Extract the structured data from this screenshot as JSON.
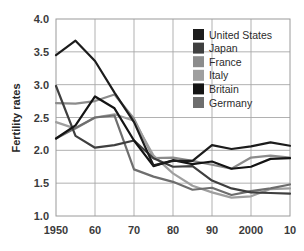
{
  "chart_data": {
    "type": "line",
    "title": "",
    "subtitle": "",
    "xlabel": "",
    "ylabel": "Fertility rates",
    "xlim": [
      1950,
      2010
    ],
    "ylim": [
      1.0,
      4.0
    ],
    "ytick_step": 0.5,
    "grid": true,
    "legend_position": "top-right",
    "x_tick_labels": [
      "1950",
      "60",
      "70",
      "80",
      "90",
      "2000",
      "10"
    ],
    "x_tick_values": [
      1950,
      1960,
      1970,
      1980,
      1990,
      2000,
      2010
    ],
    "y_tick_labels": [
      "1.0",
      "1.5",
      "2.0",
      "2.5",
      "3.0",
      "3.5",
      "4.0"
    ],
    "y_tick_values": [
      1.0,
      1.5,
      2.0,
      2.5,
      3.0,
      3.5,
      4.0
    ],
    "x": [
      1950,
      1955,
      1960,
      1965,
      1970,
      1975,
      1980,
      1985,
      1990,
      1995,
      2000,
      2005,
      2010
    ],
    "series": [
      {
        "name": "United States",
        "color": "#1c1c1c",
        "values": [
          3.45,
          3.67,
          3.36,
          2.88,
          2.43,
          1.77,
          1.84,
          1.84,
          2.08,
          2.02,
          2.06,
          2.12,
          2.07
        ]
      },
      {
        "name": "Japan",
        "color": "#3f3f3f",
        "values": [
          2.98,
          2.22,
          2.04,
          2.08,
          2.15,
          1.88,
          1.75,
          1.76,
          1.54,
          1.42,
          1.36,
          1.35,
          1.34
        ]
      },
      {
        "name": "France",
        "color": "#8c8c8c",
        "values": [
          2.72,
          2.71,
          2.75,
          2.85,
          2.48,
          1.88,
          1.89,
          1.84,
          1.78,
          1.72,
          1.89,
          1.92,
          1.89
        ]
      },
      {
        "name": "Italy",
        "color": "#9f9f9f",
        "values": [
          2.43,
          2.33,
          2.5,
          2.55,
          2.45,
          1.92,
          1.65,
          1.46,
          1.36,
          1.28,
          1.3,
          1.41,
          1.42
        ]
      },
      {
        "name": "Britain",
        "color": "#141414",
        "values": [
          2.18,
          2.38,
          2.82,
          2.64,
          2.15,
          1.76,
          1.85,
          1.79,
          1.83,
          1.72,
          1.75,
          1.87,
          1.88
        ]
      },
      {
        "name": "Germany",
        "color": "#6e6e6e",
        "values": [
          2.18,
          2.34,
          2.5,
          2.53,
          1.71,
          1.6,
          1.52,
          1.4,
          1.43,
          1.32,
          1.38,
          1.42,
          1.48
        ]
      }
    ]
  },
  "legend": {
    "entries": [
      {
        "label": "United States",
        "swatch_color": "#1c1c1c"
      },
      {
        "label": "Japan",
        "swatch_color": "#3f3f3f"
      },
      {
        "label": "France",
        "swatch_color": "#8c8c8c"
      },
      {
        "label": "Italy",
        "swatch_color": "#9f9f9f"
      },
      {
        "label": "Britain",
        "swatch_color": "#141414"
      },
      {
        "label": "Germany",
        "swatch_color": "#6e6e6e"
      }
    ]
  },
  "axes": {
    "y_title": "Fertility rates"
  },
  "style": {
    "background": "#ffffff",
    "grid_color": "#a8a8a8",
    "frame_color": "#9a9a9a",
    "tick_text_color": "#3b3b3b"
  }
}
